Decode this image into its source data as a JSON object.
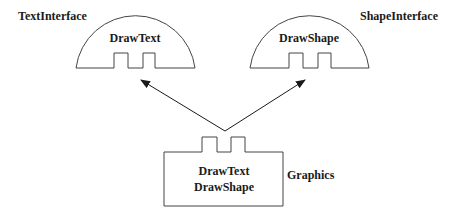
{
  "diagram": {
    "interfaces": [
      {
        "id": "text-interface",
        "name": "TextInterface",
        "method": "DrawText"
      },
      {
        "id": "shape-interface",
        "name": "ShapeInterface",
        "method": "DrawShape"
      }
    ],
    "class": {
      "name": "Graphics",
      "methods": [
        "DrawText",
        "DrawShape"
      ]
    },
    "relations": [
      {
        "from": "Graphics",
        "to": "TextInterface",
        "type": "implements-arrow"
      },
      {
        "from": "Graphics",
        "to": "ShapeInterface",
        "type": "implements-arrow"
      }
    ],
    "colors": {
      "stroke": "#444444",
      "text": "#1a1a1a",
      "background": "#ffffff"
    }
  }
}
